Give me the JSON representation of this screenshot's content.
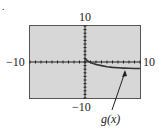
{
  "figure": {
    "marker": "."
  },
  "chart_data": {
    "type": "line",
    "title": "",
    "window": {
      "xmin": -10,
      "xmax": 10,
      "ymin": -10,
      "ymax": 10
    },
    "tick_labels": {
      "y_top": "10",
      "y_bottom": "-10",
      "x_left": "-10",
      "x_right": "10"
    },
    "series": [
      {
        "name": "g(x)",
        "x": [
          0,
          0.5,
          1,
          2,
          3,
          4,
          5,
          6,
          7,
          8,
          9,
          10
        ],
        "y": [
          0.9,
          0.3,
          -0.1,
          -0.7,
          -1.0,
          -1.3,
          -1.5,
          -1.6,
          -1.7,
          -1.75,
          -1.8,
          -1.8
        ]
      }
    ],
    "annotations": [
      {
        "text": "g(x)",
        "arrow_to": [
          8,
          -1.8
        ]
      }
    ],
    "grid": false,
    "axes_ticks": true
  }
}
